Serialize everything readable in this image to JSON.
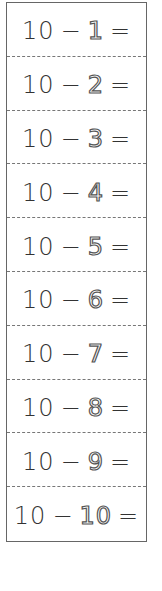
{
  "worksheet": {
    "rows": [
      {
        "minuend": "10",
        "operator": "−",
        "subtrahend": "1",
        "equals": "="
      },
      {
        "minuend": "10",
        "operator": "−",
        "subtrahend": "2",
        "equals": "="
      },
      {
        "minuend": "10",
        "operator": "−",
        "subtrahend": "3",
        "equals": "="
      },
      {
        "minuend": "10",
        "operator": "−",
        "subtrahend": "4",
        "equals": "="
      },
      {
        "minuend": "10",
        "operator": "−",
        "subtrahend": "5",
        "equals": "="
      },
      {
        "minuend": "10",
        "operator": "−",
        "subtrahend": "6",
        "equals": "="
      },
      {
        "minuend": "10",
        "operator": "−",
        "subtrahend": "7",
        "equals": "="
      },
      {
        "minuend": "10",
        "operator": "−",
        "subtrahend": "8",
        "equals": "="
      },
      {
        "minuend": "10",
        "operator": "−",
        "subtrahend": "9",
        "equals": "="
      },
      {
        "minuend": "10",
        "operator": "−",
        "subtrahend": "10",
        "equals": "="
      }
    ]
  }
}
